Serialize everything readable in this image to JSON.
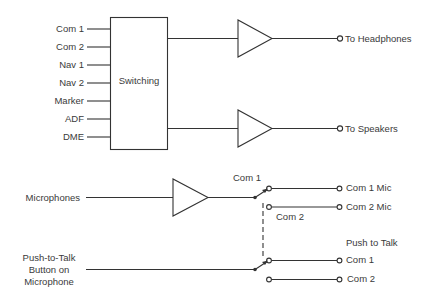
{
  "switching_block": {
    "label": "Switching",
    "inputs": [
      "Com 1",
      "Com 2",
      "Nav 1",
      "Nav 2",
      "Marker",
      "ADF",
      "DME"
    ]
  },
  "audio_outputs": [
    {
      "label": "To Headphones"
    },
    {
      "label": "To Speakers"
    }
  ],
  "microphone_section": {
    "input_label": "Microphones",
    "switch_top_label": "Com 1",
    "switch_bottom_label": "Com 2",
    "outputs": [
      "Com 1 Mic",
      "Com 2 Mic"
    ]
  },
  "ptt_section": {
    "input_label_lines": [
      "Push-to-Talk",
      "Button on",
      "Microphone"
    ],
    "group_label": "Push to Talk",
    "outputs": [
      "Com 1",
      "Com 2"
    ]
  },
  "colors": {
    "line": "#333333",
    "text": "#3a3a3a",
    "background": "#ffffff"
  }
}
